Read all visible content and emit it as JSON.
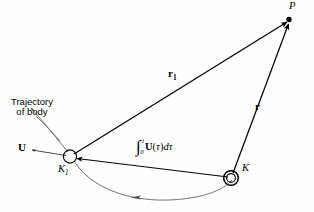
{
  "figure": {
    "type": "vector-geometry-diagram",
    "background_color": "#fefefe",
    "line_color": "#000000",
    "curve_color": "#555555",
    "width": 314,
    "height": 212
  },
  "labels": {
    "point_p": "P",
    "point_k1": "K",
    "point_k1_sub": "1",
    "point_k": "K",
    "vector_r1": "r",
    "vector_r1_sub": "1",
    "vector_r": "r",
    "vector_u": "U",
    "trajectory_line1": "Trajectory",
    "trajectory_line2": "of body"
  },
  "integral": {
    "sign": "∫",
    "upper_limit": "t",
    "lower_limit": "0",
    "integrand_vector": "U",
    "open_paren": "(",
    "variable": "τ",
    "close_paren": ")",
    "differential": "dτ"
  },
  "geometry": {
    "points": {
      "P": [
        290,
        19
      ],
      "K1": [
        70,
        157
      ],
      "K": [
        231,
        178
      ]
    },
    "vectors": [
      {
        "name": "r1",
        "from": "K1",
        "to": "P"
      },
      {
        "name": "r",
        "from": "K",
        "to": "P"
      },
      {
        "name": "displacement",
        "from": "K",
        "to": "K1"
      },
      {
        "name": "U",
        "from": "K1",
        "to": "left"
      }
    ]
  }
}
